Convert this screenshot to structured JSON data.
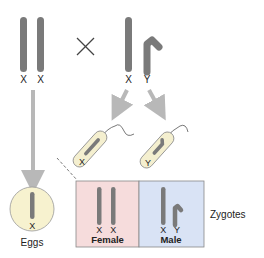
{
  "parents": {
    "mother": {
      "chromosomes": [
        "X",
        "X"
      ]
    },
    "cross_symbol": "×",
    "father": {
      "chromosomes": [
        "X",
        "Y"
      ]
    }
  },
  "sperm": [
    {
      "chromosome": "X"
    },
    {
      "chromosome": "Y"
    }
  ],
  "egg": {
    "chromosome": "X",
    "label": "Eggs"
  },
  "zygotes": {
    "label": "Zygotes",
    "female": {
      "chromosomes": [
        "X",
        "X"
      ],
      "label": "Female"
    },
    "male": {
      "chromosomes": [
        "X",
        "Y"
      ],
      "label": "Male"
    }
  },
  "colors": {
    "chromosome": "#7a7a7a",
    "arrow": "#b8b8b8",
    "female_bg": "#f6dcdc",
    "male_bg": "#d9e3f5",
    "egg_fill": "#f7f2cf",
    "sperm_fill": "#f4efcf"
  }
}
